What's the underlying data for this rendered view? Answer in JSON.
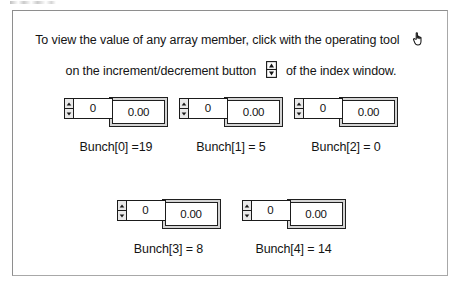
{
  "instructions": {
    "line1_before": "To view the value of any array member, click with the operating tool",
    "hand_icon": "hand-cursor-icon",
    "line2_before": "on the increment/decrement button",
    "incdec_icon": "increment-decrement-button-icon",
    "line2_after": "of the index window."
  },
  "colors": {
    "frame_border": "#8e8e8e",
    "text": "#141414",
    "control_border": "#1b1b1b",
    "indicator_face": "#d4d4d4",
    "field_background": "#ffffff"
  },
  "array_controls": [
    {
      "index_value": "0",
      "display_value": "0.00",
      "caption": "Bunch[0] =19",
      "element_name": "bunch-0"
    },
    {
      "index_value": "0",
      "display_value": "0.00",
      "caption": "Bunch[1] = 5",
      "element_name": "bunch-1"
    },
    {
      "index_value": "0",
      "display_value": "0.00",
      "caption": "Bunch[2] = 0",
      "element_name": "bunch-2"
    },
    {
      "index_value": "0",
      "display_value": "0.00",
      "caption": "Bunch[3] = 8",
      "element_name": "bunch-3"
    },
    {
      "index_value": "0",
      "display_value": "0.00",
      "caption": "Bunch[4] = 14",
      "element_name": "bunch-4"
    }
  ]
}
